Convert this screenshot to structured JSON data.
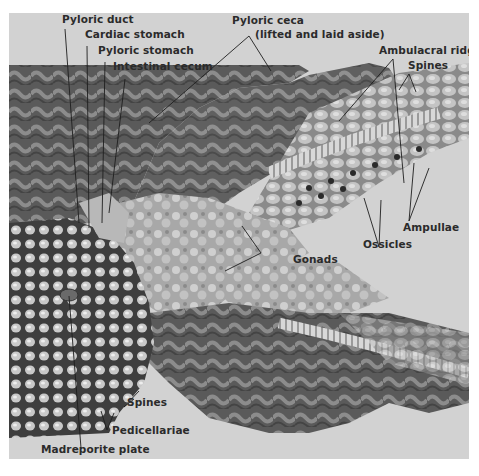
{
  "figure": {
    "colors": {
      "background": "#d2d2d2",
      "tissue_dark": "#4a4a4a",
      "tissue_mid": "#7a7a7a",
      "tissue_light": "#b0b0b0",
      "label_text": "#2b2b2b"
    },
    "labels": {
      "pyloric_duct": "Pyloric duct",
      "cardiac_stomach": "Cardiac stomach",
      "pyloric_stomach": "Pyloric stomach",
      "intestinal_cecum": "Intestinal cecum",
      "pyloric_ceca": "Pyloric ceca",
      "pyloric_ceca_note": "(lifted and laid aside)",
      "ambulacral_ridge": "Ambulacral ridge",
      "spines_top": "Spines",
      "ampullae": "Ampullae",
      "ossicles": "Ossicles",
      "gonads": "Gonads",
      "spines_bottom": "Spines",
      "pedicellariae": "Pedicellariae",
      "madreporite_plate": "Madreporite plate"
    }
  }
}
